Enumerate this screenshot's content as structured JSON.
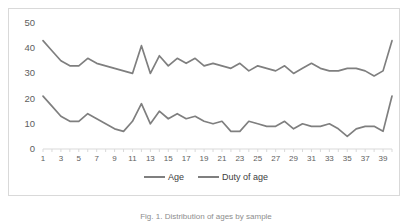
{
  "figure": {
    "caption": "Fig. 1. Distribution of ages by sample",
    "border_color": "#d9d9d9",
    "background": "#ffffff"
  },
  "legend": {
    "position": "bottom-center",
    "items": [
      {
        "label": "Age",
        "color": "#7f7f7f"
      },
      {
        "label": "Duty of age",
        "color": "#7f7f7f"
      }
    ]
  },
  "axis": {
    "y_ticks": [
      "0",
      "10",
      "20",
      "30",
      "40",
      "50"
    ],
    "x_ticks": [
      "1",
      "3",
      "5",
      "7",
      "9",
      "11",
      "13",
      "15",
      "17",
      "19",
      "21",
      "23",
      "25",
      "27",
      "29",
      "31",
      "33",
      "35",
      "37",
      "39"
    ]
  },
  "chart_data": {
    "type": "line",
    "title": "",
    "xlabel": "",
    "ylabel": "",
    "xlim": [
      1,
      40
    ],
    "ylim": [
      0,
      50
    ],
    "ytick_step": 10,
    "grid": false,
    "legend_position": "bottom",
    "x": [
      1,
      2,
      3,
      4,
      5,
      6,
      7,
      8,
      9,
      10,
      11,
      12,
      13,
      14,
      15,
      16,
      17,
      18,
      19,
      20,
      21,
      22,
      23,
      24,
      25,
      26,
      27,
      28,
      29,
      30,
      31,
      32,
      33,
      34,
      35,
      36,
      37,
      38,
      39,
      40
    ],
    "series": [
      {
        "name": "Age",
        "color": "#7f7f7f",
        "values": [
          43,
          39,
          35,
          33,
          33,
          36,
          34,
          33,
          32,
          31,
          30,
          41,
          30,
          37,
          33,
          36,
          34,
          36,
          33,
          34,
          33,
          32,
          34,
          31,
          33,
          32,
          31,
          33,
          30,
          32,
          34,
          32,
          31,
          31,
          32,
          32,
          31,
          29,
          31,
          43
        ]
      },
      {
        "name": "Duty of age",
        "color": "#7f7f7f",
        "values": [
          21,
          17,
          13,
          11,
          11,
          14,
          12,
          10,
          8,
          7,
          11,
          18,
          10,
          15,
          12,
          14,
          12,
          13,
          11,
          10,
          11,
          7,
          7,
          11,
          10,
          9,
          9,
          11,
          8,
          10,
          9,
          9,
          10,
          8,
          5,
          8,
          9,
          9,
          7,
          21
        ]
      }
    ]
  }
}
